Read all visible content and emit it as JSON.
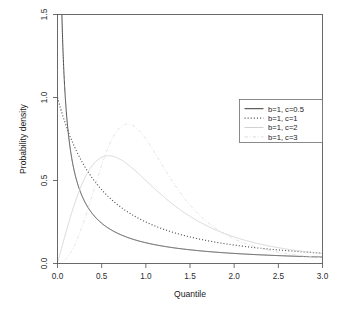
{
  "figure": {
    "background": "#ffffff",
    "frame_color": "#5a5a5a"
  },
  "axis": {
    "x_title": "Quantile",
    "y_title": "Probability density",
    "x_ticks": [
      "0.0",
      "0.5",
      "1.0",
      "1.5",
      "2.0",
      "2.5",
      "3.0"
    ],
    "y_ticks": [
      "0.0",
      "0.5",
      "1.0",
      "1.5"
    ]
  },
  "legend": {
    "items": [
      {
        "label": "b=1, c=0.5",
        "style": "solid",
        "color": "#3c3c3c"
      },
      {
        "label": "b=1, c=1",
        "style": "dotted",
        "color": "#565656"
      },
      {
        "label": "b=1, c=2",
        "style": "solid",
        "color": "#d2d2d2"
      },
      {
        "label": "b=1, c=3",
        "style": "dashdot",
        "color": "#dcdcdc"
      }
    ]
  },
  "chart_data": {
    "type": "line",
    "title": "",
    "xlabel": "Quantile",
    "ylabel": "Probability density",
    "xlim": [
      0.0,
      3.0
    ],
    "ylim": [
      0.0,
      1.5
    ],
    "xticks": [
      0.0,
      0.5,
      1.0,
      1.5,
      2.0,
      2.5,
      3.0
    ],
    "yticks": [
      0.0,
      0.5,
      1.0,
      1.5
    ],
    "grid": false,
    "legend_position": "upper right",
    "x": [
      0.0,
      0.05,
      0.1,
      0.15,
      0.2,
      0.25,
      0.3,
      0.35,
      0.4,
      0.45,
      0.5,
      0.6,
      0.7,
      0.8,
      0.9,
      1.0,
      1.1,
      1.2,
      1.3,
      1.4,
      1.5,
      1.6,
      1.7,
      1.8,
      1.9,
      2.0,
      2.2,
      2.4,
      2.6,
      2.8,
      3.0
    ],
    "series": [
      {
        "name": "b=1, c=0.5",
        "style": "solid",
        "color": "#3c3c3c",
        "values": [
          null,
          1.639,
          1.195,
          0.988,
          0.858,
          0.766,
          0.696,
          0.641,
          0.595,
          0.557,
          0.525,
          0.473,
          0.432,
          0.399,
          0.372,
          0.349,
          0.329,
          0.311,
          0.296,
          0.283,
          0.271,
          0.26,
          0.25,
          0.241,
          0.233,
          0.225,
          0.212,
          0.2,
          0.19,
          0.181,
          0.173
        ]
      },
      {
        "name": "b=1, c=1",
        "style": "dotted",
        "color": "#565656",
        "values": [
          1.0,
          0.907,
          0.826,
          0.756,
          0.694,
          0.64,
          0.592,
          0.549,
          0.51,
          0.476,
          0.444,
          0.391,
          0.346,
          0.309,
          0.277,
          0.25,
          0.227,
          0.207,
          0.189,
          0.174,
          0.16,
          0.148,
          0.137,
          0.128,
          0.119,
          0.111,
          0.098,
          0.087,
          0.077,
          0.069,
          0.063
        ]
      },
      {
        "name": "b=1, c=2",
        "style": "solid",
        "color": "#d2d2d2",
        "values": [
          0.0,
          0.0999,
          0.196,
          0.286,
          0.37,
          0.442,
          0.505,
          0.556,
          0.597,
          0.628,
          0.64,
          0.645,
          0.62,
          0.58,
          0.531,
          0.5,
          0.444,
          0.393,
          0.347,
          0.306,
          0.27,
          0.238,
          0.211,
          0.187,
          0.166,
          0.148,
          0.119,
          0.097,
          0.08,
          0.067,
          0.056
        ]
      },
      {
        "name": "b=1, c=3",
        "style": "dashdot",
        "color": "#dcdcdc",
        "values": [
          0.0,
          0.0075,
          0.03,
          0.0674,
          0.1194,
          0.1855,
          0.2647,
          0.3549,
          0.4525,
          0.5519,
          0.6452,
          0.7789,
          0.8148,
          0.7584,
          0.6552,
          0.5434,
          0.4412,
          0.3565,
          0.2889,
          0.2358,
          0.1941,
          0.1611,
          0.1348,
          0.1137,
          0.0966,
          0.0826,
          0.0621,
          0.0478,
          0.0375,
          0.0299,
          0.0242
        ]
      }
    ]
  }
}
